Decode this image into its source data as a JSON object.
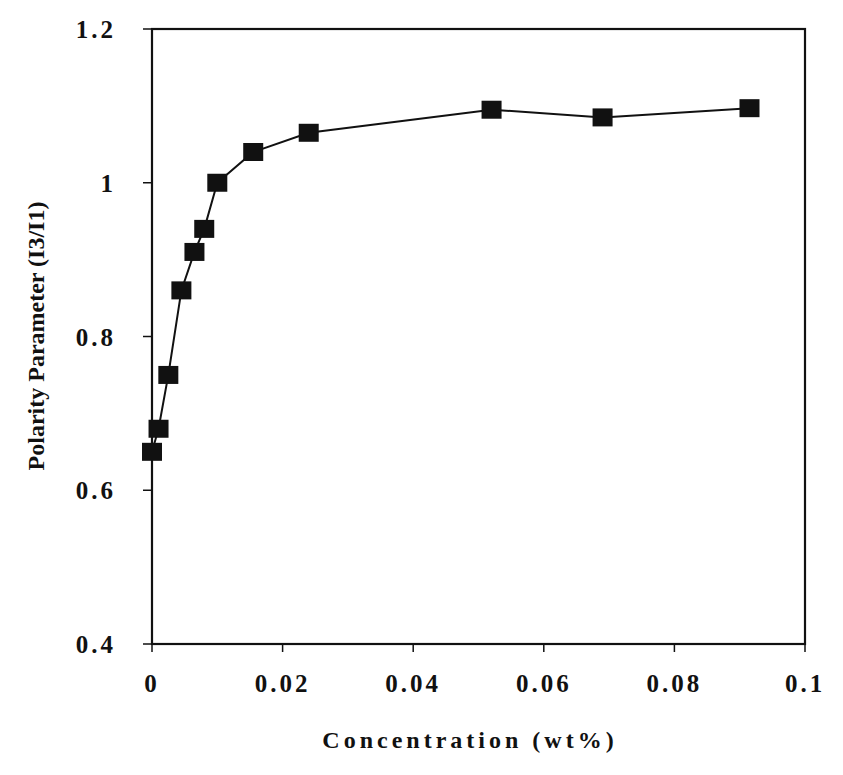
{
  "chart_data": {
    "type": "line",
    "title": "",
    "xlabel": "Concentration (wt%)",
    "ylabel": "Polarity Parameter (I3/I1)",
    "xlim": [
      0,
      0.1
    ],
    "ylim": [
      0.4,
      1.2
    ],
    "grid": false,
    "legend": null,
    "x_ticks": [
      0,
      0.02,
      0.04,
      0.06,
      0.08,
      0.1
    ],
    "x_tick_labels": [
      "0",
      "0.02",
      "0.04",
      "0.06",
      "0.08",
      "0.1"
    ],
    "y_ticks": [
      0.4,
      0.6,
      0.8,
      1.0,
      1.2
    ],
    "y_tick_labels": [
      "0.4",
      "0.6",
      "0.8",
      "1",
      "1.2"
    ],
    "series": [
      {
        "name": "I3/I1",
        "marker": "square",
        "color": "#111111",
        "x": [
          0.0,
          0.001,
          0.0025,
          0.0045,
          0.0065,
          0.008,
          0.01,
          0.0155,
          0.024,
          0.052,
          0.069,
          0.0915
        ],
        "values": [
          0.65,
          0.68,
          0.75,
          0.86,
          0.91,
          0.94,
          1.0,
          1.04,
          1.065,
          1.095,
          1.085,
          1.097
        ]
      }
    ]
  },
  "colors": {
    "axis": "#111111",
    "marker": "#111111",
    "line": "#111111",
    "background": "#ffffff"
  }
}
